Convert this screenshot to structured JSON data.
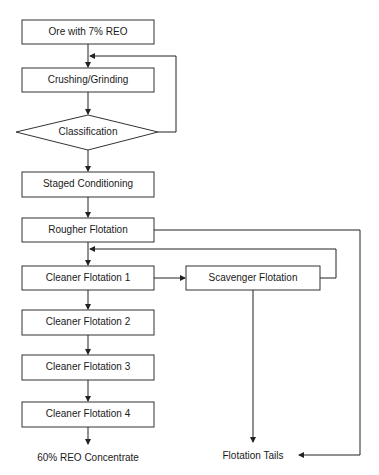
{
  "diagram": {
    "type": "process-flowchart",
    "nodes": {
      "ore": "Ore with 7% REO",
      "crushing": "Crushing/Grinding",
      "classification": "Classification",
      "conditioning": "Staged Conditioning",
      "rougher": "Rougher Flotation",
      "cleaner1": "Cleaner Flotation 1",
      "scavenger": "Scavenger Flotation",
      "cleaner2": "Cleaner Flotation 2",
      "cleaner3": "Cleaner Flotation 3",
      "cleaner4": "Cleaner Flotation 4",
      "concentrate": "60% REO Concentrate",
      "tails": "Flotation Tails"
    },
    "edges": [
      [
        "ore",
        "crushing"
      ],
      [
        "crushing",
        "classification"
      ],
      [
        "classification",
        "crushing"
      ],
      [
        "classification",
        "conditioning"
      ],
      [
        "conditioning",
        "rougher"
      ],
      [
        "rougher",
        "cleaner1"
      ],
      [
        "rougher",
        "tails"
      ],
      [
        "cleaner1",
        "scavenger"
      ],
      [
        "scavenger",
        "cleaner1"
      ],
      [
        "scavenger",
        "tails"
      ],
      [
        "cleaner1",
        "cleaner2"
      ],
      [
        "cleaner2",
        "cleaner3"
      ],
      [
        "cleaner3",
        "cleaner4"
      ],
      [
        "cleaner4",
        "concentrate"
      ]
    ]
  }
}
